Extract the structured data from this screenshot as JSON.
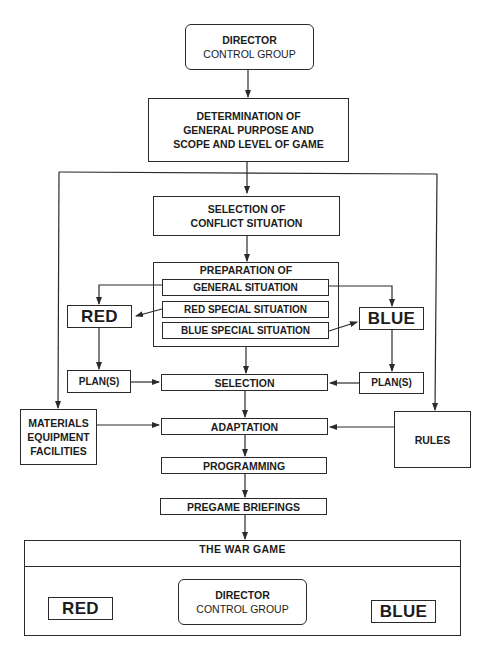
{
  "diagram": {
    "top_director": {
      "line1": "DIRECTOR",
      "line2": "CONTROL GROUP"
    },
    "determination": {
      "line1": "DETERMINATION OF",
      "line2": "GENERAL PURPOSE AND",
      "line3": "SCOPE AND LEVEL OF GAME"
    },
    "conflict_selection": {
      "line1": "SELECTION OF",
      "line2": "CONFLICT SITUATION"
    },
    "preparation": {
      "title": "PREPARATION OF",
      "general": "GENERAL SITUATION",
      "red_special": "RED SPECIAL SITUATION",
      "blue_special": "BLUE SPECIAL SITUATION"
    },
    "red": "RED",
    "blue": "BLUE",
    "red_plans": "PLAN(S)",
    "blue_plans": "PLAN(S)",
    "selection": "SELECTION",
    "materials": {
      "line1": "MATERIALS",
      "line2": "EQUIPMENT",
      "line3": "FACILITIES"
    },
    "rules": "RULES",
    "adaptation": "ADAPTATION",
    "programming": "PROGRAMMING",
    "pregame": "PREGAME BRIEFINGS",
    "war_game": {
      "title": "THE WAR GAME",
      "red": "RED",
      "blue": "BLUE",
      "director": {
        "line1": "DIRECTOR",
        "line2": "CONTROL GROUP"
      }
    }
  }
}
